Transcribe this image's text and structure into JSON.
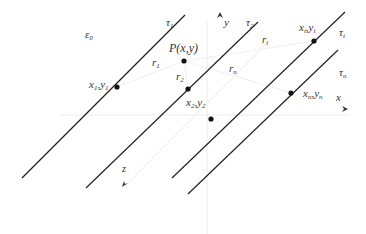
{
  "diagram": {
    "colors": {
      "line": "#222222",
      "axis": "#ececec",
      "text": "#333333",
      "point": "#111111"
    },
    "region_label": {
      "main": "ε",
      "sub": "0"
    },
    "axes": {
      "x": {
        "label": "x",
        "arrow": "➤"
      },
      "y": {
        "label": "y",
        "arrow": "➤"
      },
      "z": {
        "label": "z",
        "arrow": "➤"
      }
    },
    "lines": [
      {
        "id": "tau1",
        "label_main": "τ",
        "label_sub": "1"
      },
      {
        "id": "tau2",
        "label_main": "τ",
        "label_sub": "2"
      },
      {
        "id": "taui",
        "label_main": "τ",
        "label_sub": "i"
      },
      {
        "id": "taun",
        "label_main": "τ",
        "label_sub": "n"
      }
    ],
    "points": [
      {
        "id": "p1",
        "label_a": "x",
        "sub_a": "1",
        "sep": ",",
        "label_b": "y",
        "sub_b": "1"
      },
      {
        "id": "p2",
        "label_a": "x",
        "sub_a": "2",
        "sep": ",",
        "label_b": "y",
        "sub_b": "2"
      },
      {
        "id": "pi",
        "label_a": "x",
        "sub_a": "i",
        "sep": ",",
        "label_b": "y",
        "sub_b": "i"
      },
      {
        "id": "pn",
        "label_a": "x",
        "sub_a": "n",
        "sep": ",",
        "label_b": "y",
        "sub_b": "n"
      }
    ],
    "source_point": {
      "label": "P(x,y)"
    },
    "distances": [
      {
        "id": "r1",
        "main": "r",
        "sub": "1"
      },
      {
        "id": "r2",
        "main": "r",
        "sub": "2"
      },
      {
        "id": "ri",
        "main": "r",
        "sub": "i"
      },
      {
        "id": "rn",
        "main": "r",
        "sub": "n"
      }
    ]
  }
}
